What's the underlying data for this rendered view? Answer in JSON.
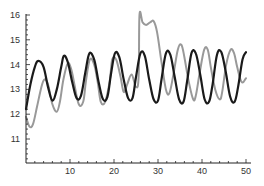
{
  "chart_data": {
    "type": "line",
    "title": "",
    "xlabel": "",
    "ylabel": "",
    "xlim": [
      0,
      51
    ],
    "ylim": [
      10.1,
      16.1
    ],
    "x_ticks": [
      10,
      20,
      30,
      40,
      50
    ],
    "y_ticks": [
      11,
      12,
      13,
      14,
      15,
      16
    ],
    "x_tick_labels": [
      "10",
      "20",
      "30",
      "40",
      "50"
    ],
    "y_tick_labels": [
      "11",
      "12",
      "13",
      "14",
      "15",
      "16"
    ],
    "grid": false,
    "legend": null,
    "series": [
      {
        "name": "black",
        "color": "#1a1a1a",
        "width": 2.2,
        "x": [
          0,
          1,
          2,
          2.8,
          4,
          5,
          6,
          7,
          8,
          8.6,
          9.5,
          10.5,
          11.5,
          12.5,
          13.5,
          14.4,
          15.5,
          16.5,
          17.5,
          18.5,
          19.3,
          20.2,
          21.2,
          22.2,
          23.2,
          24.2,
          25,
          26,
          27,
          28,
          29,
          30,
          30.8,
          31.8,
          32.8,
          33.8,
          34.8,
          35.8,
          36.6,
          37.6,
          38.6,
          39.6,
          40.6,
          41.6,
          42.4,
          43.4,
          44.4,
          45.4,
          46.4,
          47.4,
          48.2,
          49.2,
          50
        ],
        "y": [
          12.2,
          13.2,
          13.9,
          14.15,
          13.9,
          13.1,
          12.55,
          13.0,
          13.9,
          14.35,
          14.1,
          13.3,
          12.65,
          12.75,
          13.7,
          14.45,
          14.2,
          13.3,
          12.6,
          12.7,
          13.6,
          14.45,
          14.3,
          13.4,
          12.65,
          12.65,
          13.5,
          14.45,
          14.35,
          13.4,
          12.6,
          12.55,
          13.4,
          14.45,
          14.4,
          13.5,
          12.6,
          12.5,
          13.3,
          14.45,
          14.45,
          13.6,
          12.6,
          12.5,
          13.2,
          14.4,
          14.5,
          13.7,
          12.7,
          12.5,
          13.1,
          14.2,
          14.5
        ]
      },
      {
        "name": "gray",
        "color": "#999999",
        "width": 2.0,
        "x": [
          0,
          0.8,
          1.6,
          2.5,
          3.5,
          4.2,
          5,
          6,
          7,
          7.7,
          8.5,
          9.5,
          10.3,
          11,
          12,
          13,
          13.6,
          14.5,
          15.5,
          16.3,
          17,
          18,
          19,
          19.6,
          20.5,
          21.5,
          22.2,
          23,
          24,
          25,
          25.6,
          25.8,
          26.5,
          27.3,
          28.2,
          29,
          29.8,
          30.8,
          31.8,
          32.6,
          33.5,
          34.5,
          35.3,
          36,
          37,
          38,
          38.6,
          39.5,
          40.5,
          41.3,
          42,
          43,
          44,
          44.6,
          45.5,
          46.5,
          47.3,
          48,
          49,
          50
        ],
        "y": [
          11.9,
          11.5,
          11.6,
          12.3,
          13.1,
          13.4,
          13.2,
          12.4,
          12.1,
          12.5,
          13.4,
          14.05,
          13.8,
          13.2,
          12.4,
          12.5,
          13.3,
          14.2,
          14.0,
          13.3,
          12.5,
          12.5,
          13.3,
          14.2,
          14.2,
          13.5,
          12.9,
          13.2,
          13.6,
          13.1,
          13.5,
          16.0,
          15.7,
          15.6,
          15.7,
          15.75,
          15.3,
          14.1,
          13.0,
          12.85,
          13.6,
          14.6,
          14.8,
          14.3,
          13.3,
          12.6,
          12.75,
          13.7,
          14.6,
          14.6,
          13.9,
          13.0,
          12.6,
          12.9,
          14.0,
          14.6,
          14.45,
          13.9,
          13.3,
          13.45
        ]
      }
    ]
  }
}
